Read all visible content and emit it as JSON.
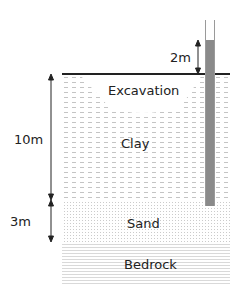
{
  "diagram": {
    "type": "soil-profile-cross-section",
    "layers": [
      {
        "name": "Excavation",
        "label": "Excavation"
      },
      {
        "name": "Clay",
        "label": "Clay",
        "thickness_label": "10m"
      },
      {
        "name": "Sand",
        "label": "Sand",
        "thickness_label": "3m"
      },
      {
        "name": "Bedrock",
        "label": "Bedrock"
      }
    ],
    "dimensions": {
      "standpipe_head": "2m",
      "clay_thickness": "10m",
      "sand_thickness": "3m"
    },
    "colors": {
      "ground_line": "#222222",
      "pipe_fill": "#8a8a8a",
      "pipe_wall": "#9a9a9a",
      "pattern": "#c8c8c8"
    }
  }
}
